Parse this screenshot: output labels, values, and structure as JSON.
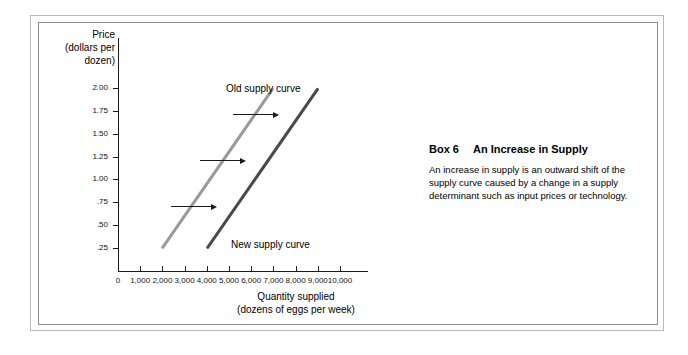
{
  "figure": {
    "background_color": "#ffffff",
    "frame_color_outer": "#b9b9b9",
    "frame_color_inner": "#8d8d8d"
  },
  "axes": {
    "y_title_lines": [
      "Price",
      "(dollars per",
      "dozen)"
    ],
    "x_title_lines": [
      "Quantity supplied",
      "(dozens of eggs per week)"
    ]
  },
  "box": {
    "number_label": "Box 6",
    "title": "An Increase in Supply",
    "body": "An increase in supply is an outward shift of the supply curve caused by a change in a supply determinant such as input prices or technology."
  },
  "chart_data": {
    "type": "line",
    "title": "An Increase in Supply",
    "xlabel": "Quantity supplied (dozens of eggs per week)",
    "ylabel": "Price (dollars per dozen)",
    "xlim": [
      0,
      10000
    ],
    "ylim": [
      0,
      2.0
    ],
    "grid": false,
    "legend": "inline-labels",
    "x_ticks": [
      0,
      1000,
      2000,
      3000,
      4000,
      5000,
      6000,
      7000,
      8000,
      9000,
      10000
    ],
    "x_tick_labels": [
      "0",
      "1,000",
      "2,000",
      "3,000",
      "4,000",
      "5,000",
      "6,000",
      "7,000",
      "8,000",
      "9,000",
      "10,000"
    ],
    "y_ticks": [
      0.25,
      0.5,
      0.75,
      1.0,
      1.25,
      1.5,
      1.75,
      2.0
    ],
    "y_tick_labels": [
      ".25",
      ".50",
      ".75",
      "1.00",
      "1.25",
      "1.50",
      "1.75",
      "2.00"
    ],
    "series": [
      {
        "name": "Old supply curve",
        "label": "Old supply curve",
        "color": "#9a9a9a",
        "points": [
          [
            2000,
            0.25
          ],
          [
            7000,
            2.0
          ]
        ]
      },
      {
        "name": "New supply curve",
        "label": "New supply curve",
        "color": "#4a4a4a",
        "points": [
          [
            4000,
            0.25
          ],
          [
            9000,
            2.0
          ]
        ]
      }
    ],
    "annotations": [
      {
        "type": "arrow",
        "label": "supply shift at .75",
        "from": [
          2400,
          0.71
        ],
        "to": [
          4400,
          0.71
        ]
      },
      {
        "type": "arrow",
        "label": "supply shift at 1.25",
        "from": [
          3700,
          1.21
        ],
        "to": [
          5700,
          1.21
        ]
      },
      {
        "type": "arrow",
        "label": "supply shift at 1.75",
        "from": [
          5200,
          1.72
        ],
        "to": [
          7200,
          1.72
        ]
      }
    ]
  }
}
